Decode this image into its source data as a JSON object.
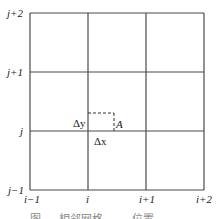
{
  "diagram": {
    "row_labels": [
      "j+2",
      "j+1",
      "j",
      "j−1"
    ],
    "col_labels": [
      "i−1",
      "i",
      "i+1",
      "i+2"
    ],
    "point_label": "A",
    "dx_label": "Δx",
    "dy_label": "Δy",
    "caption": "图  …  相邻网格  ……  位置",
    "colors": {
      "grid": "#4a4a4a",
      "dashed": "#333333",
      "text": "#222222"
    }
  }
}
